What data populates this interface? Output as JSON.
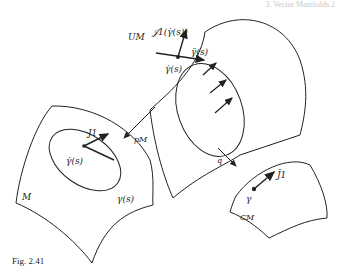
{
  "header": {
    "text": "3. Vector Manifolds 2"
  },
  "caption": "Fig. 2.41",
  "manifolds": {
    "M": {
      "label": "M",
      "curve_label": "γ(s)",
      "velocity_label": "γ̇(s)",
      "field_label": "J1"
    },
    "UM": {
      "label": "UM",
      "point_label": "γ̇(s)",
      "tangent_label": "γ̈(s)",
      "fiber_label": "𝒥1(γ̇(s))"
    },
    "CM": {
      "label": "CM",
      "point_label": "γ",
      "vector_label": "J̄1"
    }
  },
  "maps": {
    "pM": "pM",
    "q": "q"
  },
  "colors": {
    "ink": "#222222",
    "background": "#ffffff"
  }
}
